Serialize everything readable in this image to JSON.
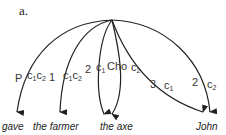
{
  "title": "a.",
  "words": [
    {
      "text": "gave",
      "x": 2
    },
    {
      "text": "the farmer",
      "x": 33
    },
    {
      "text": "the axe",
      "x": 100
    },
    {
      "text": "John",
      "x": 196
    }
  ],
  "labels": {
    "p": "P",
    "p_c1": "c",
    "p_c1_sub": "1",
    "p_c2": "c",
    "p_c2_sub": "2",
    "one": "1",
    "one_c1": "c",
    "one_c1_sub": "1",
    "one_c2": "c",
    "one_c2_sub": "2",
    "two": "2",
    "two_c1": "c",
    "two_c1_sub": "1",
    "cho": "Cho",
    "cho_c2": "c",
    "cho_c2_sub": "2",
    "three": "3",
    "three_c1": "c",
    "three_c1_sub": "1",
    "twoj": "2",
    "twoj_c2": "c",
    "twoj_c2_sub": "2"
  },
  "colors": {
    "line": "#222222",
    "text": "#333333"
  }
}
